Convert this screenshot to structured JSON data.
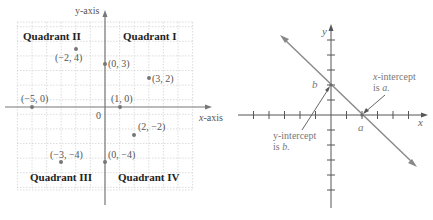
{
  "left_diagram": {
    "y_axis_label": "y-axis",
    "x_axis_label": "x-axis",
    "origin_label": "0",
    "quadrants": [
      {
        "name": "Quadrant II",
        "x": 23,
        "y": 40
      },
      {
        "name": "Quadrant I",
        "x": 123,
        "y": 40
      },
      {
        "name": "Quadrant III",
        "x": 30,
        "y": 181
      },
      {
        "name": "Quadrant IV",
        "x": 118,
        "y": 181
      }
    ],
    "points": [
      {
        "label": "(−2, 4)",
        "x": -2,
        "y": 4
      },
      {
        "label": "(0, 3)",
        "x": 0,
        "y": 3
      },
      {
        "label": "(3, 2)",
        "x": 3,
        "y": 2
      },
      {
        "label": "(−5, 0)",
        "x": -5,
        "y": 0
      },
      {
        "label": "(1, 0)",
        "x": 1,
        "y": 0
      },
      {
        "label": "(2, −2)",
        "x": 2,
        "y": -2
      },
      {
        "label": "(−3, −4)",
        "x": -3,
        "y": -4
      },
      {
        "label": "(0, −4)",
        "x": 0,
        "y": -4
      }
    ],
    "colors": {
      "grid": "#cfcfcf",
      "axis": "#777777",
      "point": "#777777",
      "text": "#555555"
    }
  },
  "right_diagram": {
    "y_axis_label": "y",
    "x_axis_label": "x",
    "b_label": "b",
    "a_label": "a",
    "x_intercept_callout": [
      "x-intercept",
      "is a."
    ],
    "y_intercept_callout": [
      "y-intercept",
      "is b."
    ],
    "colors": {
      "axis": "#555555",
      "line": "#888888",
      "text": "#777777"
    }
  }
}
